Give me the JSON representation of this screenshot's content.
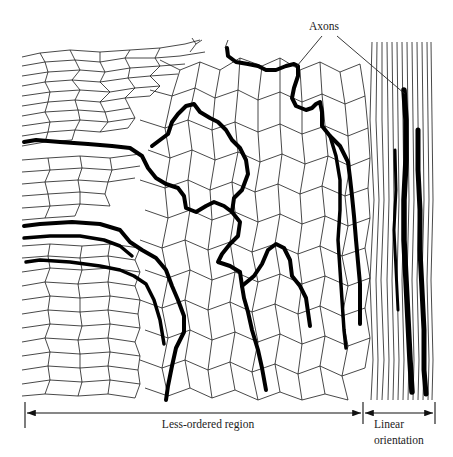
{
  "figure": {
    "labels": {
      "axons": "Axons",
      "less_ordered": "Less-ordered region",
      "linear_line1": "Linear",
      "linear_line2": "orientation"
    },
    "regions": [
      {
        "name": "Less-ordered region",
        "x_start": 25,
        "x_end": 363
      },
      {
        "name": "Linear orientation",
        "x_start": 363,
        "x_end": 434
      }
    ],
    "colors": {
      "ink": "#000000",
      "background": "#ffffff"
    }
  }
}
